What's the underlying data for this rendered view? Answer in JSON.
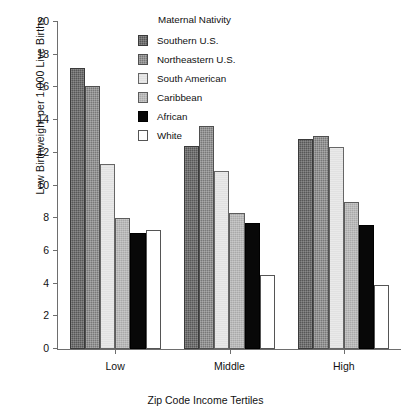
{
  "chart_data": {
    "type": "bar",
    "title": "",
    "xlabel": "Zip Code Income Tertiles",
    "ylabel": "Low Birthweight per 1,000 Live Births",
    "categories": [
      "Low",
      "Middle",
      "High"
    ],
    "ylim": [
      0,
      20
    ],
    "yticks": [
      0,
      2,
      4,
      6,
      8,
      10,
      12,
      14,
      16,
      18,
      20
    ],
    "grid": false,
    "legend_position": "top-center-inside",
    "legend_title": "Maternal Nativity",
    "series": [
      {
        "name": "Southern U.S.",
        "values": [
          17.2,
          12.4,
          12.85
        ],
        "color": "#575757"
      },
      {
        "name": "Northeastern U.S.",
        "values": [
          16.1,
          13.65,
          13.0
        ],
        "color": "#787878"
      },
      {
        "name": "South American",
        "values": [
          11.3,
          10.9,
          12.35
        ],
        "color": "#e9e9e9"
      },
      {
        "name": "Caribbean",
        "values": [
          8.0,
          8.3,
          9.0
        ],
        "color": "#a9a9a9"
      },
      {
        "name": "African",
        "values": [
          7.1,
          7.7,
          7.6
        ],
        "color": "#080808"
      },
      {
        "name": "White",
        "values": [
          7.3,
          4.5,
          3.9
        ],
        "color": "#ffffff"
      }
    ]
  },
  "axes": {
    "ylabel": "Low Birthweight per 1,000 Live Births",
    "xlabel": "Zip Code Income Tertiles",
    "ytick_labels": [
      "0",
      "2",
      "4",
      "6",
      "8",
      "10",
      "12",
      "14",
      "16",
      "18",
      "20"
    ],
    "xtick_labels": [
      "Low",
      "Middle",
      "High"
    ]
  },
  "legend": {
    "title": "Maternal Nativity",
    "items": [
      {
        "label": "Southern U.S."
      },
      {
        "label": "Northeastern U.S."
      },
      {
        "label": "South American"
      },
      {
        "label": "Caribbean"
      },
      {
        "label": "African"
      },
      {
        "label": "White"
      }
    ]
  }
}
